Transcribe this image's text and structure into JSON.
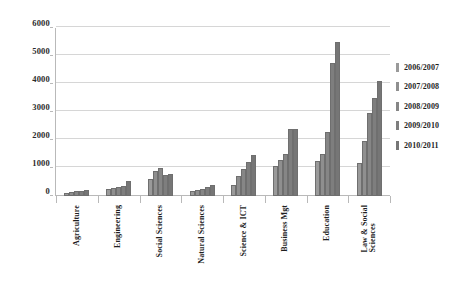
{
  "chart_data": {
    "type": "bar",
    "title": "",
    "xlabel": "",
    "ylabel": "",
    "ylim": [
      0,
      6000
    ],
    "yticks": [
      0,
      1000,
      2000,
      3000,
      4000,
      5000,
      6000
    ],
    "ytick_labels": [
      "0",
      "1000",
      "2000",
      "3000",
      "4000",
      "5000",
      "6000"
    ],
    "grid": true,
    "legend_position": "right",
    "categories": [
      "Agriculture",
      "Engineering",
      "Social Sciences",
      "Natural Sciences",
      "Science & ICT",
      "Business Mgt",
      "Education",
      "Law & Social\nSciences"
    ],
    "series": [
      {
        "name": "2006/2007",
        "values": [
          120,
          250,
          620,
          180,
          380,
          1080,
          1250,
          1180
        ]
      },
      {
        "name": "2007/2008",
        "values": [
          150,
          300,
          880,
          220,
          700,
          1300,
          1500,
          1950
        ]
      },
      {
        "name": "2008/2009",
        "values": [
          170,
          330,
          1000,
          250,
          950,
          1500,
          2300,
          2950
        ]
      },
      {
        "name": "2009/2010",
        "values": [
          185,
          350,
          760,
          330,
          1200,
          2400,
          4750,
          3500
        ]
      },
      {
        "name": "2010/2011",
        "values": [
          200,
          520,
          780,
          400,
          1450,
          2400,
          5500,
          4100
        ]
      }
    ]
  }
}
